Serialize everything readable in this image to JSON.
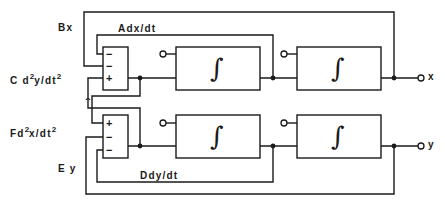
{
  "diagram": {
    "type": "analog computer block diagram (coupled second-order equations)",
    "line_color": "#1a1a1a",
    "background": "#ffffff",
    "labels": {
      "bx": "Bx",
      "adx_dt": "Adx/dt",
      "cd2y": {
        "prefix": "C d",
        "exp1": "2",
        "mid": "y/dt",
        "exp2": "2"
      },
      "fd2x": {
        "prefix": "Fd",
        "exp1": "2",
        "mid": "x/dt",
        "exp2": "2"
      },
      "ey": "E y",
      "ddy_dt": "Ddy/dt"
    },
    "summers": [
      {
        "name": "summer-x",
        "signs": [
          "−",
          "−",
          "+"
        ]
      },
      {
        "name": "summer-y",
        "signs": [
          "+",
          "−",
          "−"
        ]
      }
    ],
    "integrators": [
      {
        "name": "integrator-x1",
        "symbol": "∫"
      },
      {
        "name": "integrator-x2",
        "symbol": "∫"
      },
      {
        "name": "integrator-y1",
        "symbol": "∫"
      },
      {
        "name": "integrator-y2",
        "symbol": "∫"
      }
    ],
    "outputs": {
      "top": "x",
      "bottom": "y"
    }
  }
}
